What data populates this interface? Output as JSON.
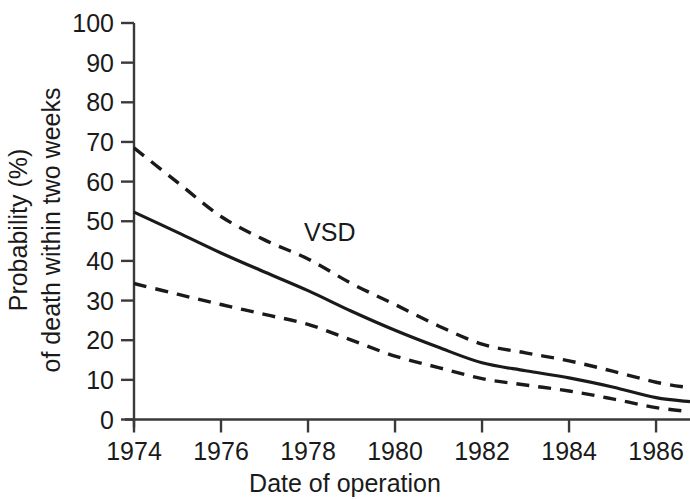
{
  "figure": {
    "name": "vsd-mortality-trend-chart",
    "background_color": "#ffffff",
    "ink_color": "#1a1a1a"
  },
  "chart_data": {
    "type": "line",
    "title": "",
    "subtitle": "",
    "xlabel": "Date of operation",
    "ylabel": "Probability (%)\nof death within two weeks",
    "ylabel_line1": "Probability (%)",
    "ylabel_line2": "of death within two weeks",
    "xlim": [
      1974,
      1986.78
    ],
    "ylim": [
      0,
      100
    ],
    "xticks": [
      1974,
      1976,
      1978,
      1980,
      1982,
      1984,
      1986
    ],
    "xtick_labels": [
      "1974",
      "1976",
      "1978",
      "1980",
      "1982",
      "1984",
      "1986"
    ],
    "yticks": [
      0,
      10,
      20,
      30,
      40,
      50,
      60,
      70,
      80,
      90,
      100
    ],
    "ytick_labels": [
      "0",
      "10",
      "20",
      "30",
      "40",
      "50",
      "60",
      "70",
      "80",
      "90",
      "100"
    ],
    "grid": false,
    "legend_position": "none",
    "annotations": [
      {
        "text": "VSD",
        "x": 1978.5,
        "y": 45,
        "name": "vsd-annotation"
      }
    ],
    "x": [
      1974,
      1975,
      1976,
      1977,
      1978,
      1979,
      1980,
      1981,
      1982,
      1983,
      1984,
      1985,
      1986,
      1986.78
    ],
    "series": [
      {
        "name": "Upper 95% confidence limit",
        "style": "dashed",
        "values": [
          68.5,
          59.8,
          51.2,
          45.3,
          40.5,
          34.3,
          29.0,
          23.6,
          19.0,
          16.8,
          14.8,
          12.2,
          9.4,
          8.0
        ]
      },
      {
        "name": "Estimated probability",
        "style": "solid",
        "values": [
          52.3,
          47.2,
          42.0,
          37.2,
          32.5,
          27.3,
          22.5,
          18.2,
          14.3,
          12.3,
          10.5,
          8.2,
          5.5,
          4.5
        ]
      },
      {
        "name": "Lower 95% confidence limit",
        "style": "dashed",
        "values": [
          34.3,
          31.6,
          29.0,
          26.5,
          24.0,
          20.0,
          16.0,
          13.1,
          10.3,
          8.7,
          7.2,
          5.2,
          3.0,
          2.0
        ]
      }
    ]
  }
}
